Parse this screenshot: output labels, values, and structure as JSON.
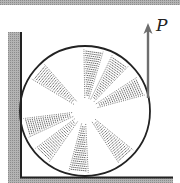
{
  "figure": {
    "force_label": "P",
    "colors": {
      "background": "#ffffff",
      "ground_fill": "#a8a8a8",
      "outline": "#222222",
      "arrow": "#6e6e6e",
      "hatch": "#555555"
    },
    "wheel": {
      "center_x": 85,
      "center_y": 111,
      "radius": 65,
      "spokes": [
        {
          "angle_deg": 140
        },
        {
          "angle_deg": 82
        },
        {
          "angle_deg": 55
        },
        {
          "angle_deg": 24
        },
        {
          "angle_deg": 196
        },
        {
          "angle_deg": 226
        },
        {
          "angle_deg": 264
        },
        {
          "angle_deg": 312
        }
      ],
      "spoke_half_width_deg": 9,
      "spoke_inner_radius": 13,
      "spoke_outer_radius": 62
    },
    "wall": {
      "x": 8,
      "y": 32,
      "width": 13,
      "height": 150
    },
    "floor": {
      "x": 8,
      "y": 177,
      "width": 165,
      "height": 6
    },
    "top_band": {
      "height": 5
    },
    "arrow": {
      "x": 148,
      "y_start": 98,
      "y_end": 24
    }
  }
}
